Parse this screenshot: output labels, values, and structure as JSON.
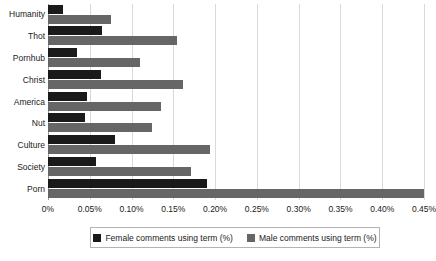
{
  "chart_data": {
    "type": "bar",
    "orientation": "horizontal",
    "title": "",
    "xlabel": "",
    "ylabel": "",
    "xlim": [
      0,
      0.45
    ],
    "xticks": [
      0,
      0.05,
      0.1,
      0.15,
      0.2,
      0.25,
      0.3,
      0.35,
      0.4,
      0.45
    ],
    "xtick_labels": [
      "0%",
      "0.05%",
      "0.10%",
      "0.15%",
      "0.20%",
      "0.25%",
      "0.30%",
      "0.35%",
      "0.40%",
      "0.45%"
    ],
    "grid": true,
    "grid_axis": "x",
    "legend_position": "bottom",
    "categories": [
      "Humanity",
      "Thot",
      "Pornhub",
      "Christ",
      "America",
      "Nut",
      "Culture",
      "Society",
      "Porn"
    ],
    "series": [
      {
        "name": "Female comments using term (%)",
        "color": "#1a1a1a",
        "values": [
          0.018,
          0.065,
          0.035,
          0.064,
          0.047,
          0.044,
          0.08,
          0.057,
          0.19
        ]
      },
      {
        "name": "Male comments using term (%)",
        "color": "#666666",
        "values": [
          0.075,
          0.154,
          0.11,
          0.162,
          0.135,
          0.124,
          0.194,
          0.171,
          0.45
        ]
      }
    ]
  },
  "legend": {
    "entries": [
      {
        "label": "Female comments using term (%)"
      },
      {
        "label": "Male comments using term (%)"
      }
    ]
  },
  "colors": {
    "female_series": "#1a1a1a",
    "male_series": "#666666",
    "gridline": "#d9d9d9",
    "axis": "#9a9a9a",
    "legend_border": "#b3b3b3",
    "background": "#ffffff"
  }
}
